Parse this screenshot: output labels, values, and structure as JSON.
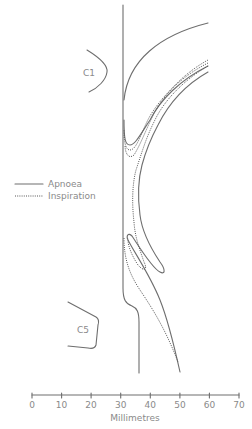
{
  "figure": {
    "type": "diagram",
    "labels": {
      "c1": "C1",
      "c5": "C5"
    },
    "legend": {
      "items": [
        {
          "label": "Apnoea",
          "style": "solid"
        },
        {
          "label": "Inspiration",
          "style": "dotted"
        }
      ]
    },
    "axis": {
      "label": "Millimetres",
      "ticks": [
        "0",
        "10",
        "20",
        "30",
        "40",
        "50",
        "60",
        "70"
      ],
      "range": [
        0,
        70
      ]
    },
    "colors": {
      "line": "#6e6e6e",
      "text": "#8a8a8a"
    }
  }
}
